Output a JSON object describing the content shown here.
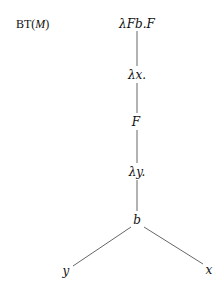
{
  "title": {
    "prefix": "BT(",
    "var": "M",
    "suffix": ")"
  },
  "tree": {
    "nodes": [
      {
        "id": "root",
        "label": "λFb.F"
      },
      {
        "id": "lam-x",
        "label": "λx."
      },
      {
        "id": "F",
        "label": "F"
      },
      {
        "id": "lam-y",
        "label": "λy."
      },
      {
        "id": "b",
        "label": "b"
      },
      {
        "id": "y",
        "label": "y"
      },
      {
        "id": "x",
        "label": "x"
      }
    ],
    "edges": [
      [
        "root",
        "lam-x"
      ],
      [
        "lam-x",
        "F"
      ],
      [
        "F",
        "lam-y"
      ],
      [
        "lam-y",
        "b"
      ],
      [
        "b",
        "y"
      ],
      [
        "b",
        "x"
      ]
    ]
  },
  "colors": {
    "line": "#555555",
    "text": "#111111"
  }
}
